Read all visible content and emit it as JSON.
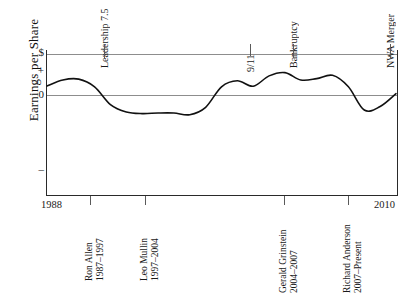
{
  "chart_data": {
    "type": "line",
    "title": "",
    "subtitle": "",
    "ylabel": "Earnings per Share",
    "xlabel": "",
    "xlim": [
      1988,
      2010
    ],
    "ylim": [
      -3.2,
      1.6
    ],
    "grid": false,
    "legend_position": "none",
    "y_tick_labels": [
      "$",
      "+",
      "0",
      "–"
    ],
    "y_tick_values": [
      1.5,
      0.9,
      0,
      -2.2
    ],
    "x_tick_labels": [
      "1988",
      "2010"
    ],
    "x_tick_values": [
      1988,
      2010
    ],
    "reference_lines": [
      {
        "name": "dollar-rule",
        "y": 1.5
      },
      {
        "name": "zero-rule",
        "y": 0
      }
    ],
    "series": [
      {
        "name": "Earnings per Share",
        "color": "#111111",
        "x": [
          1988,
          1989,
          1990,
          1991,
          1992,
          1993,
          1994,
          1995,
          1996,
          1997,
          1998,
          1999,
          2000,
          2001,
          2002,
          2003,
          2004,
          2005,
          2006,
          2007,
          2008,
          2009,
          2010
        ],
        "values": [
          0.33,
          0.55,
          0.58,
          0.3,
          -0.35,
          -0.62,
          -0.68,
          -0.66,
          -0.66,
          -0.72,
          -0.45,
          0.3,
          0.52,
          0.32,
          0.7,
          0.82,
          0.55,
          0.6,
          0.72,
          0.3,
          -0.55,
          -0.42,
          0.05
        ]
      }
    ],
    "annotations": [
      {
        "name": "leadership-7-5",
        "label": "Leadership 7.5",
        "x": 1994
      },
      {
        "name": "nine-eleven",
        "label": "9/11",
        "x": 2001
      },
      {
        "name": "bankruptcy",
        "label": "Bankruptcy",
        "x": 2005
      },
      {
        "name": "nwa-merger",
        "label": "NWA Merger",
        "x": 2008
      }
    ],
    "ceo_tenures": [
      {
        "name": "ron-allen",
        "label": "Ron Allen",
        "years": "1987–1997"
      },
      {
        "name": "leo-mullin",
        "label": "Leo Mullin",
        "years": "1997–2004"
      },
      {
        "name": "gerald-grinstein",
        "label": "Gerald Grinstein",
        "years": "2004–2007"
      },
      {
        "name": "richard-anderson",
        "label": "Richard Anderson",
        "years": "2007–Present"
      }
    ]
  },
  "axis": {
    "y_title": "Earnings per Share",
    "y_ticks": {
      "dollar": "$",
      "plus": "+",
      "zero": "0",
      "minus": "–"
    },
    "x_ticks": {
      "start": "1988",
      "end": "2010"
    }
  },
  "events": {
    "leadership": "Leadership 7.5",
    "nine_eleven": "9/11",
    "bankruptcy": "Bankruptcy",
    "nwa_merger": "NWA Merger"
  },
  "ceos": {
    "allen_name": "Ron Allen",
    "allen_years": "1987–1997",
    "mullin_name": "Leo Mullin",
    "mullin_years": "1997–2004",
    "grinstein_name": "Gerald Grinstein",
    "grinstein_years": "2004–2007",
    "anderson_name": "Richard Anderson",
    "anderson_years": "2007–Present"
  },
  "colors": {
    "curve": "#111111",
    "axis": "#2a2a2a",
    "rule": "#8d8d8d",
    "background": "#ffffff"
  }
}
